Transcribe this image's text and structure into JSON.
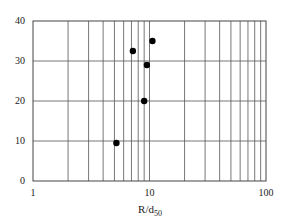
{
  "chart_data": {
    "type": "scatter",
    "title": "",
    "xlabel": "R/d",
    "xlabel_subscript": "50",
    "ylabel": "",
    "xscale": "log",
    "xlim": [
      1,
      100
    ],
    "ylim": [
      0,
      40
    ],
    "grid": true,
    "legend": null,
    "x_ticks": [
      1,
      10,
      100
    ],
    "x_tick_labels": [
      "1",
      "10",
      "100"
    ],
    "y_ticks": [
      0,
      10,
      20,
      30,
      40
    ],
    "y_tick_labels": [
      "0",
      "10",
      "20",
      "30",
      "40"
    ],
    "series": [
      {
        "name": "data",
        "marker": "filled-circle",
        "color": "#000000",
        "points": [
          {
            "x": 5.2,
            "y": 9.5
          },
          {
            "x": 7.2,
            "y": 32.5
          },
          {
            "x": 9.0,
            "y": 20.0
          },
          {
            "x": 9.5,
            "y": 29.0
          },
          {
            "x": 10.6,
            "y": 35.0
          }
        ]
      }
    ]
  },
  "style": {
    "grid_color": "#555555",
    "axis_color": "#444444",
    "marker_color": "#000000"
  }
}
